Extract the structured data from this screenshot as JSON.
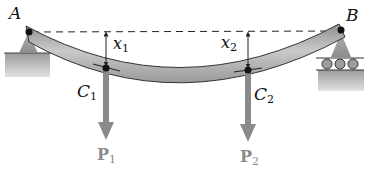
{
  "diagram": {
    "type": "simply supported beam deflection",
    "points": {
      "A": {
        "label": "A"
      },
      "B": {
        "label": "B"
      },
      "C1": {
        "letter": "C",
        "sub": "1"
      },
      "C2": {
        "letter": "C",
        "sub": "2"
      }
    },
    "deflections": [
      {
        "letter": "x",
        "sub": "1"
      },
      {
        "letter": "x",
        "sub": "2"
      }
    ],
    "loads": [
      {
        "letter": "P",
        "sub": "1"
      },
      {
        "letter": "P",
        "sub": "2"
      }
    ],
    "supports": {
      "left": "pin support",
      "right": "roller support"
    },
    "colors": {
      "beam": "#a8a8a8",
      "load_arrow": "#8a8a8a",
      "ground": "#c4c4c4",
      "line": "#222222"
    }
  }
}
